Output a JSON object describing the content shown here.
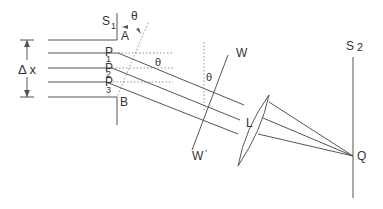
{
  "figure": {
    "colors": {
      "line": "#555555",
      "text": "#333333",
      "background": "#ffffff"
    }
  },
  "labels": {
    "s1": {
      "main": "S",
      "sub": "1"
    },
    "s2": {
      "main": "S",
      "sub": "2"
    },
    "a": "A",
    "b": "B",
    "theta_top": "θ",
    "theta_mid": "θ",
    "theta_wave": "θ",
    "p1": {
      "main": "P",
      "sub": "1"
    },
    "p2": {
      "main": "P",
      "sub": "2"
    },
    "p3": {
      "main": "P",
      "sub": "3"
    },
    "delta_x": "Δ x",
    "w": "W",
    "w_prime": "W",
    "w_prime_mark": "'",
    "lens": "L",
    "q": "Q"
  }
}
